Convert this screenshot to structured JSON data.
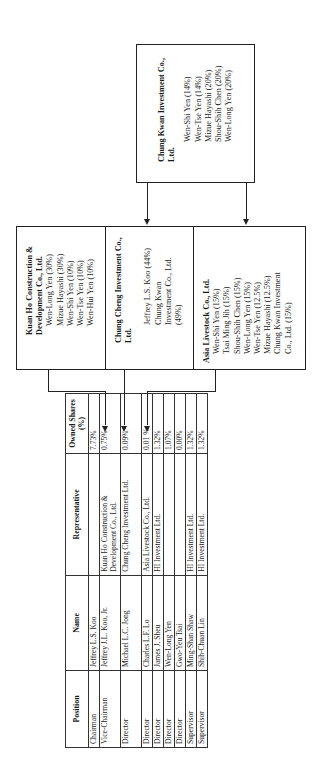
{
  "diagram": {
    "orientation": "rotated 90deg counter-clockwise",
    "top_holder": {
      "title": "Chung Kwan Investment Co., Ltd.",
      "members": [
        "Wen-Shi Yen (14%)",
        "Wen-Tse Yen (14%)",
        "Mizue Hayashi (20%)",
        "Shou-Shih Chen (20%)",
        "Wen-Long Yen (20%)"
      ]
    },
    "middle_holders": [
      {
        "title": "Kuan Ho Construction & Development Co., Ltd.",
        "members": [
          "Wen-Long Yen (30%)",
          "Mizue Hayashi (30%)",
          "Wen-Shi Yen (10%)",
          "Wen-Tse Yen (10%)",
          "Wen-Hui Yen (10%)"
        ]
      },
      {
        "title": "Chung Cheng Investment Co., Ltd.",
        "members": [
          "Jeffrey L.S. Koo (44%)",
          "Chung Kwan Investment Co., Ltd. (49%)"
        ]
      },
      {
        "title": "Asia Livestock Co., Ltd.",
        "members": [
          "Wen-Shi Yen (15%)",
          "Tsai Ming Jih (15%)",
          "Shou-Shih Chen (15%)",
          "Wen-Long Yen (15%)",
          "Wen-Tse Yen (12.5%)",
          "Mizue Hayashi (12.5%)",
          "Chung Kwan Investment Co., Ltd. (15%)"
        ]
      }
    ],
    "table": {
      "headers": [
        "Position",
        "Name",
        "Representative",
        "Owned Shares (%)"
      ],
      "rows": [
        [
          "Chairman",
          "Jeffrey L.S. Koo",
          "",
          "7.73%"
        ],
        [
          "Vice-Chairman",
          "Jeffrey J.L. Koo, Jr.",
          "Kuan Ho Construction & Development Co., Ltd.",
          "0.75%"
        ],
        [
          "Director",
          "Michael L.C. Jong",
          "Chung Cheng Investment Ltd.",
          "0.09%"
        ],
        [
          "Director",
          "Charles L.F. Lo",
          "Asia Livestock Co., Ltd.",
          "0.01 %"
        ],
        [
          "Director",
          "James J. Sheu",
          "HI Investment Ltd.",
          "1.32%"
        ],
        [
          "Director",
          "Wen-Long Yen",
          "",
          "1.07%"
        ],
        [
          "Director",
          "Gwo-Yeu Tsai",
          "",
          "0.00%"
        ],
        [
          "Supervisor",
          "Ming-Shan Shaw",
          "HI Investment Ltd.",
          "1.32%"
        ],
        [
          "Supervisor",
          "Shih-Chuan Lin",
          "HI Investment Ltd.",
          "1.32%"
        ]
      ]
    },
    "colors": {
      "line": "#222222",
      "text": "#1a1a1a",
      "background": "#ffffff"
    }
  }
}
